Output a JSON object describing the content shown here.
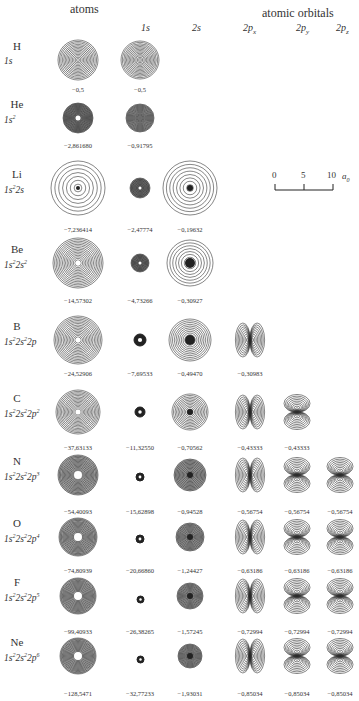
{
  "header": {
    "atoms_label": "atoms",
    "orbitals_label": "atomic orbitals",
    "columns": [
      {
        "id": "1s",
        "label": "1s"
      },
      {
        "id": "2s",
        "label": "2s"
      },
      {
        "id": "2px",
        "label": "2p",
        "sub": "x"
      },
      {
        "id": "2py",
        "label": "2p",
        "sub": "y"
      },
      {
        "id": "2pz",
        "label": "2p",
        "sub": "z"
      }
    ]
  },
  "scale_bar": {
    "ticks": [
      "0",
      "5",
      "10"
    ],
    "unit": "a",
    "unit_sub": "0"
  },
  "rows": [
    {
      "element": "H",
      "config": "1s",
      "atom_energy": "−0,5",
      "orbitals": {
        "1s": "−0,5"
      }
    },
    {
      "element": "He",
      "config": "1s²",
      "atom_energy": "−2,861680",
      "orbitals": {
        "1s": "−0,91795"
      }
    },
    {
      "element": "Li",
      "config": "1s²2s",
      "atom_energy": "−7,236414",
      "orbitals": {
        "1s": "−2,47774",
        "2s": "−0,19632"
      }
    },
    {
      "element": "Be",
      "config": "1s²2s²",
      "atom_energy": "−14,57302",
      "orbitals": {
        "1s": "−4,73266",
        "2s": "−0,30927"
      }
    },
    {
      "element": "B",
      "config": "1s²2s²2p",
      "atom_energy": "−24,52906",
      "orbitals": {
        "1s": "−7,69533",
        "2s": "−0,49470",
        "2px": "−0,30983"
      }
    },
    {
      "element": "C",
      "config": "1s²2s²2p²",
      "atom_energy": "−37,63133",
      "orbitals": {
        "1s": "−11,32550",
        "2s": "−0,70562",
        "2px": "−0,43333",
        "2py": "−0,43333"
      }
    },
    {
      "element": "N",
      "config": "1s²2s²2p³",
      "atom_energy": "−54,40093",
      "orbitals": {
        "1s": "−15,62898",
        "2s": "−0,94528",
        "2px": "−0,56754",
        "2py": "−0,56754",
        "2pz": "−0,56754"
      }
    },
    {
      "element": "O",
      "config": "1s²2s²2p⁴",
      "atom_energy": "−74,80939",
      "orbitals": {
        "1s": "−20,66860",
        "2s": "−1,24427",
        "2px": "−0,63186",
        "2py": "−0,63186",
        "2pz": "−0,63186"
      }
    },
    {
      "element": "F",
      "config": "1s²2s²2p⁵",
      "atom_energy": "−99,40933",
      "orbitals": {
        "1s": "−26,38265",
        "2s": "−1,57245",
        "2px": "−0,72994",
        "2py": "−0,72994",
        "2pz": "−0,72994"
      }
    },
    {
      "element": "Ne",
      "config": "1s²2s²2p⁶",
      "atom_energy": "−128,5471",
      "orbitals": {
        "1s": "−32,77233",
        "2s": "−1,93031",
        "2px": "−0,85034",
        "2py": "−0,85034",
        "2pz": "−0,85034"
      }
    }
  ],
  "colors": {
    "line": "#222222",
    "text": "#333333",
    "background": "#ffffff"
  }
}
